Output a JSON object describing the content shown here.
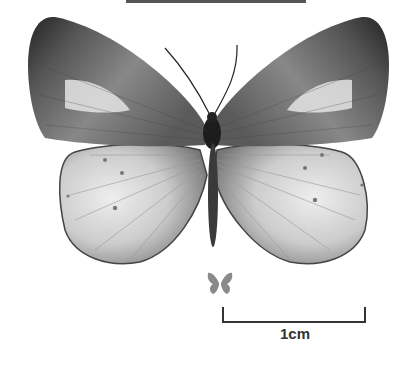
{
  "image": {
    "subject": "butterfly specimen, dorsal view",
    "colors": {
      "background": "#ffffff",
      "forewing_dark": "#2a2a2a",
      "forewing_mid": "#7a7a7a",
      "patch_light": "#e6e6e6",
      "hindwing": "#cfcfcf",
      "body": "#1f1f1f",
      "scale_line": "#333333",
      "size_icon": "#8a8a8a"
    }
  },
  "scale_bar": {
    "label": "1cm"
  }
}
